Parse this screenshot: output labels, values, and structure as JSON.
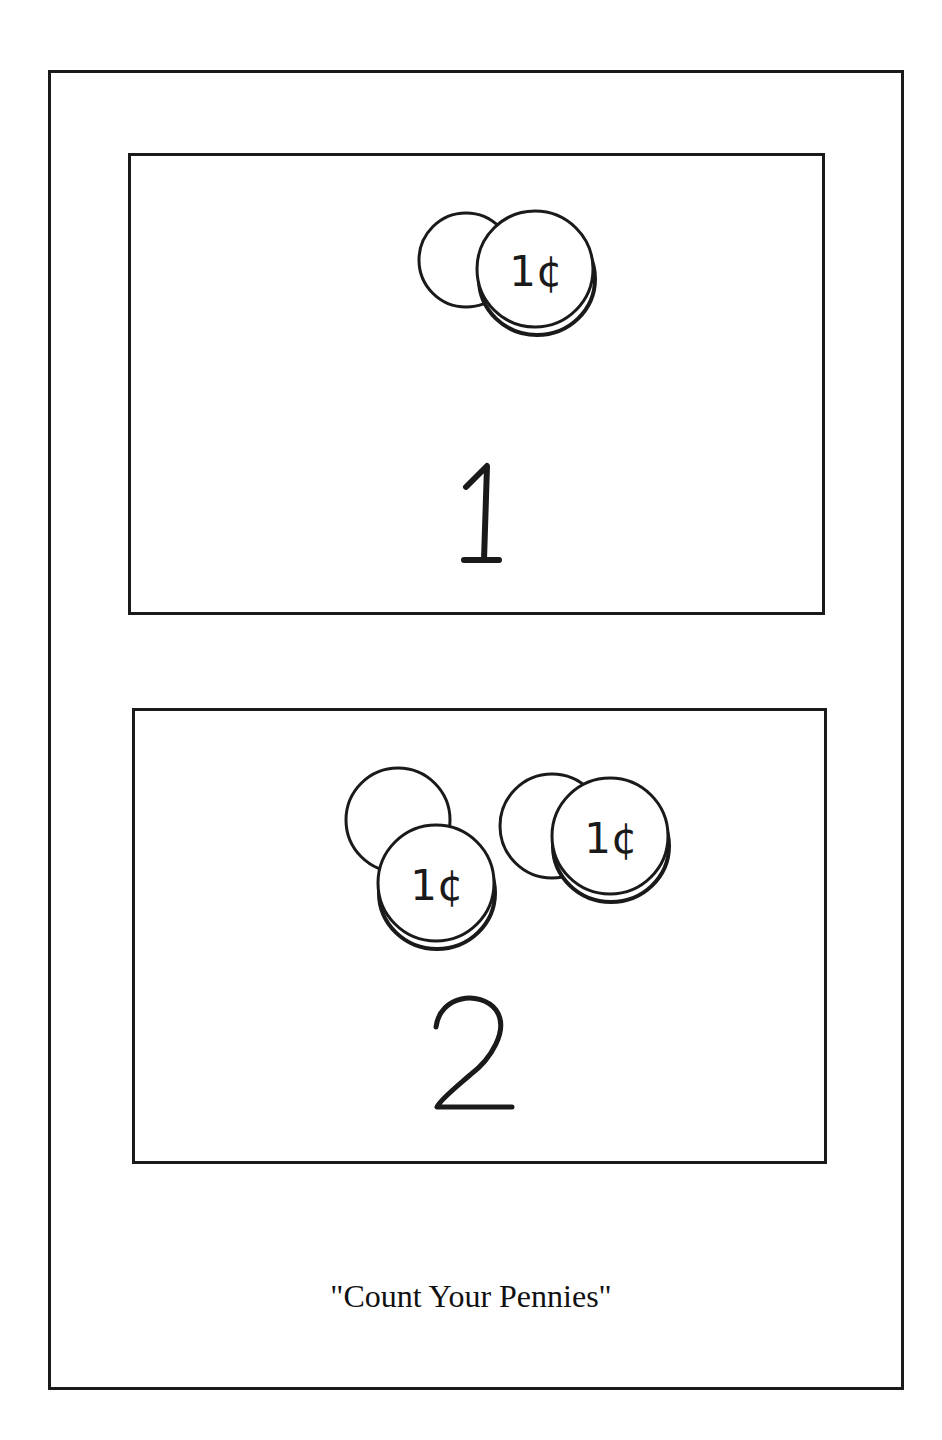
{
  "worksheet": {
    "caption": "\"Count Your Pennies\"",
    "stroke_color": "#1a1a1a",
    "panels": [
      {
        "number": "1",
        "coin_count": 1,
        "coin_label": "1¢",
        "coins": [
          {
            "type": "penny-stack",
            "label": "1¢"
          }
        ]
      },
      {
        "number": "2",
        "coin_count": 2,
        "coin_label": "1¢",
        "coins": [
          {
            "type": "penny-stack",
            "label": "1¢"
          },
          {
            "type": "penny-stack",
            "label": "1¢"
          }
        ]
      }
    ]
  }
}
